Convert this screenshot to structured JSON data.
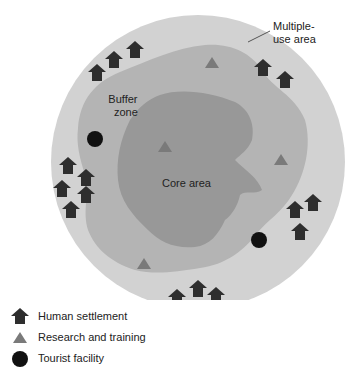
{
  "diagram": {
    "zones": {
      "multiple_use": {
        "label": "Multiple-\nuse area",
        "line1": "Multiple-",
        "line2": "use area",
        "color": "#d2d2d2"
      },
      "buffer": {
        "label": "Buffer zone",
        "line1": "Buffer",
        "line2": "zone",
        "color": "#b4b4b4"
      },
      "core": {
        "label": "Core area",
        "color": "#989898"
      }
    },
    "colors": {
      "settlement": "#2e2e2e",
      "research": "#7a7a7a",
      "tourist": "#111111",
      "background": "#ffffff"
    },
    "settlements": [
      [
        97,
        73
      ],
      [
        114,
        60
      ],
      [
        135,
        50
      ],
      [
        263,
        68
      ],
      [
        285,
        80
      ],
      [
        68,
        166
      ],
      [
        86,
        178
      ],
      [
        62,
        189
      ],
      [
        86,
        195
      ],
      [
        71,
        210
      ],
      [
        295,
        210
      ],
      [
        313,
        203
      ],
      [
        300,
        232
      ],
      [
        177,
        298
      ],
      [
        198,
        289
      ],
      [
        216,
        296
      ]
    ],
    "research_sites": [
      [
        212,
        63
      ],
      [
        165,
        147
      ],
      [
        281,
        160
      ],
      [
        144,
        264
      ]
    ],
    "tourist_facilities": [
      [
        95,
        139
      ],
      [
        259,
        240
      ]
    ]
  },
  "legend": {
    "items": [
      {
        "icon": "house-icon",
        "label": "Human settlement"
      },
      {
        "icon": "triangle-icon",
        "label": "Research and training"
      },
      {
        "icon": "circle-icon",
        "label": "Tourist facility"
      }
    ]
  }
}
